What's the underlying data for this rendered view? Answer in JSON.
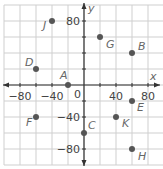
{
  "chart_data": {
    "type": "scatter",
    "title": "",
    "xlabel": "x",
    "ylabel": "y",
    "xlim": [
      -100,
      100
    ],
    "ylim": [
      -100,
      100
    ],
    "grid": true,
    "grid_step": 20,
    "x_ticks": [
      -80,
      -40,
      40,
      80
    ],
    "y_ticks": [
      80,
      -40,
      -80
    ],
    "origin_label": "0",
    "points": [
      {
        "label": "J",
        "x": -40,
        "y": 80
      },
      {
        "label": "G",
        "x": 20,
        "y": 60
      },
      {
        "label": "B",
        "x": 60,
        "y": 40
      },
      {
        "label": "D",
        "x": -60,
        "y": 20
      },
      {
        "label": "A",
        "x": -20,
        "y": 0
      },
      {
        "label": "E",
        "x": 60,
        "y": -20
      },
      {
        "label": "F",
        "x": -60,
        "y": -40
      },
      {
        "label": "K",
        "x": 40,
        "y": -40
      },
      {
        "label": "C",
        "x": 0,
        "y": -60
      },
      {
        "label": "H",
        "x": 60,
        "y": -80
      }
    ]
  },
  "colors": {
    "grid": "#cfcfcf",
    "axis": "#333333",
    "point": "#555555",
    "label": "#666666"
  }
}
